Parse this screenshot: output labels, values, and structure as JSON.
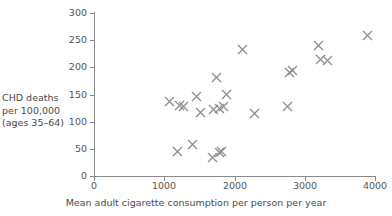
{
  "chart_data": {
    "type": "scatter",
    "title": "",
    "xlabel": "Mean adult cigarette consumption per person per year",
    "ylabel": "CHD deaths per 100,000 (ages 35–64)",
    "ylabel_lines": [
      "CHD deaths",
      "per 100,000",
      "(ages 35–64)"
    ],
    "xlim": [
      0,
      4000
    ],
    "ylim": [
      0,
      300
    ],
    "xticks": [
      0,
      1000,
      2000,
      3000,
      4000
    ],
    "xtick_labels": [
      "0",
      "1000",
      "2000",
      "3000",
      "4000"
    ],
    "yticks": [
      0,
      50,
      100,
      150,
      200,
      250,
      300
    ],
    "ytick_labels": [
      "0",
      "50",
      "100",
      "150",
      "200",
      "250",
      "300"
    ],
    "grid": false,
    "legend": null,
    "marker": "x",
    "marker_color": "#8c8c8c",
    "axis_color": "#8a8a8a",
    "points": [
      {
        "x": 1080,
        "y": 137
      },
      {
        "x": 1190,
        "y": 46
      },
      {
        "x": 1220,
        "y": 130
      },
      {
        "x": 1270,
        "y": 128
      },
      {
        "x": 1400,
        "y": 58
      },
      {
        "x": 1460,
        "y": 147
      },
      {
        "x": 1510,
        "y": 116
      },
      {
        "x": 1680,
        "y": 34
      },
      {
        "x": 1700,
        "y": 122
      },
      {
        "x": 1740,
        "y": 181
      },
      {
        "x": 1780,
        "y": 43
      },
      {
        "x": 1790,
        "y": 125
      },
      {
        "x": 1820,
        "y": 45
      },
      {
        "x": 1840,
        "y": 127
      },
      {
        "x": 1890,
        "y": 150
      },
      {
        "x": 2120,
        "y": 233
      },
      {
        "x": 2280,
        "y": 115
      },
      {
        "x": 2760,
        "y": 127
      },
      {
        "x": 2790,
        "y": 190
      },
      {
        "x": 2820,
        "y": 194
      },
      {
        "x": 3190,
        "y": 240
      },
      {
        "x": 3220,
        "y": 215
      },
      {
        "x": 3320,
        "y": 212
      },
      {
        "x": 3900,
        "y": 258
      }
    ]
  }
}
